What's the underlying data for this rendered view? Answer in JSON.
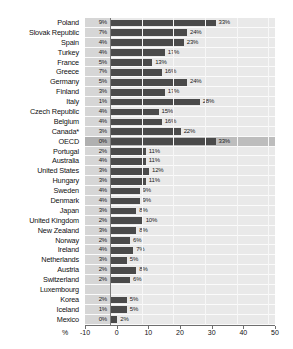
{
  "chart_data": {
    "type": "bar",
    "orientation": "horizontal",
    "title": "",
    "subtitle": "",
    "xlabel": "%",
    "ylabel": "",
    "xlim": [
      -10,
      50
    ],
    "xticks": [
      "-10",
      "0",
      "10",
      "20",
      "30",
      "40",
      "50"
    ],
    "grid": true,
    "legend": "none",
    "axis_unit_label": "%",
    "highlight_row": "OECD",
    "note_marker": "*",
    "series": [
      {
        "name": "left value",
        "unit": "%"
      },
      {
        "name": "right value",
        "unit": "%"
      }
    ],
    "categories": [
      "Poland",
      "Slovak Republic",
      "Spain",
      "Turkey",
      "France",
      "Greece",
      "Germany",
      "Finland",
      "Italy",
      "Czech Republic",
      "Belgium",
      "Canada*",
      "OECD",
      "Portugal",
      "Australia",
      "United States",
      "Hungary",
      "Sweden",
      "Denmark",
      "Japan",
      "United Kingdom",
      "New Zealand",
      "Norway",
      "Ireland",
      "Netherlands",
      "Austria",
      "Switzerland",
      "Luxembourg",
      "Korea",
      "Iceland",
      "Mexico"
    ],
    "left_values": [
      9,
      7,
      4,
      4,
      5,
      7,
      5,
      3,
      1,
      4,
      4,
      3,
      0,
      2,
      4,
      3,
      3,
      4,
      4,
      3,
      2,
      3,
      2,
      4,
      3,
      2,
      2,
      null,
      2,
      1,
      0
    ],
    "right_values": [
      33,
      24,
      23,
      17,
      13,
      16,
      24,
      17,
      28,
      15,
      16,
      22,
      33,
      11,
      11,
      12,
      11,
      9,
      9,
      8,
      10,
      8,
      6,
      7,
      5,
      8,
      6,
      null,
      5,
      5,
      2
    ]
  },
  "rows": [
    {
      "label": "Poland",
      "left": "9%",
      "right": "33%",
      "value": 33,
      "highlight": false
    },
    {
      "label": "Slovak Republic",
      "left": "7%",
      "right": "24%",
      "value": 24,
      "highlight": false
    },
    {
      "label": "Spain",
      "left": "4%",
      "right": "23%",
      "value": 23,
      "highlight": false
    },
    {
      "label": "Turkey",
      "left": "4%",
      "right": "17%",
      "value": 17,
      "highlight": false
    },
    {
      "label": "France",
      "left": "5%",
      "right": "13%",
      "value": 13,
      "highlight": false
    },
    {
      "label": "Greece",
      "left": "7%",
      "right": "16%",
      "value": 16,
      "highlight": false
    },
    {
      "label": "Germany",
      "left": "5%",
      "right": "24%",
      "value": 24,
      "highlight": false
    },
    {
      "label": "Finland",
      "left": "3%",
      "right": "17%",
      "value": 17,
      "highlight": false
    },
    {
      "label": "Italy",
      "left": "1%",
      "right": "28%",
      "value": 28,
      "highlight": false
    },
    {
      "label": "Czech Republic",
      "left": "4%",
      "right": "15%",
      "value": 15,
      "highlight": false
    },
    {
      "label": "Belgium",
      "left": "4%",
      "right": "16%",
      "value": 16,
      "highlight": false
    },
    {
      "label": "Canada*",
      "left": "3%",
      "right": "22%",
      "value": 22,
      "highlight": false
    },
    {
      "label": "OECD",
      "left": "0%",
      "right": "33%",
      "value": 33,
      "highlight": true
    },
    {
      "label": "Portugal",
      "left": "2%",
      "right": "11%",
      "value": 11,
      "highlight": false
    },
    {
      "label": "Australia",
      "left": "4%",
      "right": "11%",
      "value": 11,
      "highlight": false
    },
    {
      "label": "United States",
      "left": "3%",
      "right": "12%",
      "value": 12,
      "highlight": false
    },
    {
      "label": "Hungary",
      "left": "3%",
      "right": "11%",
      "value": 11,
      "highlight": false
    },
    {
      "label": "Sweden",
      "left": "4%",
      "right": "9%",
      "value": 9,
      "highlight": false
    },
    {
      "label": "Denmark",
      "left": "4%",
      "right": "9%",
      "value": 9,
      "highlight": false
    },
    {
      "label": "Japan",
      "left": "3%",
      "right": "8%",
      "value": 8,
      "highlight": false
    },
    {
      "label": "United Kingdom",
      "left": "2%",
      "right": "10%",
      "value": 10,
      "highlight": false
    },
    {
      "label": "New Zealand",
      "left": "3%",
      "right": "8%",
      "value": 8,
      "highlight": false
    },
    {
      "label": "Norway",
      "left": "2%",
      "right": "6%",
      "value": 6,
      "highlight": false
    },
    {
      "label": "Ireland",
      "left": "4%",
      "right": "7%",
      "value": 7,
      "highlight": false
    },
    {
      "label": "Netherlands",
      "left": "3%",
      "right": "5%",
      "value": 5,
      "highlight": false
    },
    {
      "label": "Austria",
      "left": "2%",
      "right": "8%",
      "value": 8,
      "highlight": false
    },
    {
      "label": "Switzerland",
      "left": "2%",
      "right": "6%",
      "value": 6,
      "highlight": false
    },
    {
      "label": "Luxembourg",
      "left": "",
      "right": "",
      "value": 0,
      "highlight": false
    },
    {
      "label": "Korea",
      "left": "2%",
      "right": "5%",
      "value": 5,
      "highlight": false
    },
    {
      "label": "Iceland",
      "left": "1%",
      "right": "5%",
      "value": 5,
      "highlight": false
    },
    {
      "label": "Mexico",
      "left": "0%",
      "right": "2%",
      "value": 2,
      "highlight": false
    }
  ],
  "axis": {
    "unit": "%",
    "ticks": [
      "-10",
      "0",
      "10",
      "20",
      "30",
      "40",
      "50"
    ]
  },
  "colors": {
    "bar": "#4a4a4a",
    "plot_background": "#e9e9e9",
    "band": "#d6d6d6",
    "highlight": "#bdbdbd",
    "gridline": "#f7f7f7",
    "axis": "#6e6e6e",
    "text": "#111111"
  }
}
